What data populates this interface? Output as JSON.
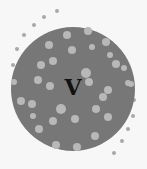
{
  "diagram": {
    "label": "V",
    "colors": {
      "background": "#f7f7f7",
      "circle": "#777777",
      "dot_inside": "#b8b8b8",
      "dot_outside": "#a8a8a8",
      "label": "#111111"
    },
    "circle": {
      "cx": 73,
      "cy": 89,
      "r": 62
    },
    "inside_dots": [
      [
        67,
        35,
        4
      ],
      [
        88,
        31,
        4
      ],
      [
        49,
        45,
        4
      ],
      [
        72,
        50,
        4
      ],
      [
        92,
        47,
        3
      ],
      [
        106,
        42,
        4
      ],
      [
        41,
        65,
        4
      ],
      [
        53,
        61,
        4
      ],
      [
        110,
        55,
        3
      ],
      [
        116,
        64,
        4
      ],
      [
        124,
        68,
        3
      ],
      [
        38,
        80,
        4
      ],
      [
        50,
        86,
        4
      ],
      [
        86,
        73,
        5
      ],
      [
        89,
        82,
        4
      ],
      [
        108,
        90,
        4
      ],
      [
        103,
        97,
        4
      ],
      [
        131,
        84,
        3
      ],
      [
        14,
        82,
        3
      ],
      [
        21,
        101,
        4
      ],
      [
        32,
        104,
        4
      ],
      [
        61,
        109,
        5
      ],
      [
        33,
        116,
        3
      ],
      [
        96,
        109,
        4
      ],
      [
        108,
        117,
        4
      ],
      [
        53,
        121,
        4
      ],
      [
        75,
        119,
        4
      ],
      [
        39,
        129,
        4
      ],
      [
        95,
        136,
        4
      ],
      [
        56,
        145,
        4
      ],
      [
        77,
        147,
        4
      ],
      [
        128,
        83,
        3
      ]
    ],
    "outside_dots": [
      [
        57,
        11,
        2
      ],
      [
        44,
        17,
        2
      ],
      [
        34,
        25,
        2
      ],
      [
        24,
        35,
        2
      ],
      [
        17,
        49,
        2
      ],
      [
        13,
        65,
        2
      ],
      [
        134,
        100,
        2
      ],
      [
        133,
        116,
        2
      ],
      [
        128,
        129,
        2
      ],
      [
        122,
        141,
        2
      ],
      [
        114,
        153,
        2
      ]
    ]
  }
}
